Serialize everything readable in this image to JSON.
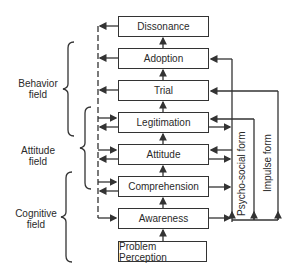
{
  "diagram": {
    "stages": [
      {
        "id": "dissonance",
        "label": "Dissonance"
      },
      {
        "id": "adoption",
        "label": "Adoption"
      },
      {
        "id": "trial",
        "label": "Trial"
      },
      {
        "id": "legitimation",
        "label": "Legitimation"
      },
      {
        "id": "attitude",
        "label": "Attitude"
      },
      {
        "id": "comprehension",
        "label": "Comprehension"
      },
      {
        "id": "awareness",
        "label": "Awareness"
      },
      {
        "id": "problem_perception",
        "label": "Problem Perception"
      }
    ],
    "fields": [
      {
        "id": "behavior",
        "line1": "Behavior",
        "line2": "field"
      },
      {
        "id": "attitude",
        "line1": "Attitude",
        "line2": "field"
      },
      {
        "id": "cognitive",
        "line1": "Cognitive",
        "line2": "field"
      }
    ],
    "paths": [
      {
        "id": "psycho_social",
        "label": "Psycho-social form"
      },
      {
        "id": "impulse",
        "label": "Impulse form"
      }
    ],
    "colors": {
      "line": "#333333",
      "text": "#2a2a2a",
      "background": "#ffffff"
    }
  }
}
